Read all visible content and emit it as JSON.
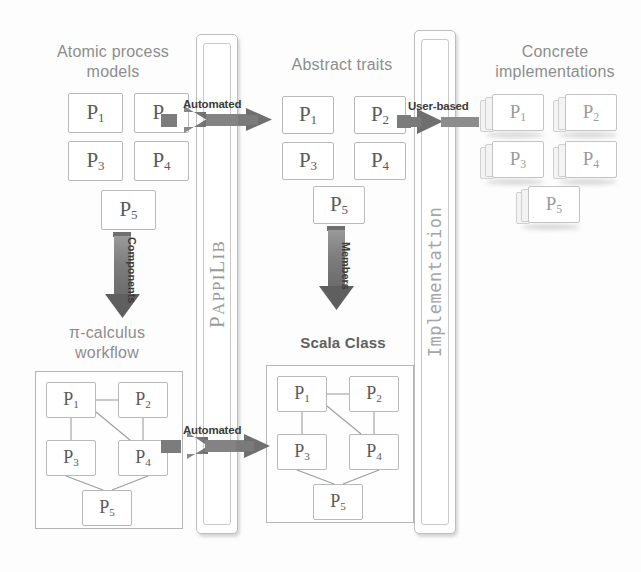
{
  "diagram": {
    "colors": {
      "heading": "#8d8d8d",
      "heading_dark": "#5f6062",
      "box_border": "#b9b9b9",
      "box_text": "#5a5a5a",
      "arrow": "#808080",
      "arrow_dark": "#6e6e6e",
      "arrow_label": "#3b3b3b",
      "pillar_text": "#9a9a9a",
      "background": "#fdfdfd"
    },
    "headings": {
      "atomic_process_models": "Atomic process\nmodels",
      "abstract_traits": "Abstract traits",
      "concrete_implementations": "Concrete\nimplementations",
      "pi_calculus_workflow": "π-calculus\nworkflow",
      "scala_class": "Scala Class"
    },
    "pillars": [
      {
        "name": "pappilib",
        "label": "PAPPILIB",
        "label_caps": "P",
        "label_rest": "APPI",
        "label_caps2": "L",
        "label_rest2": "IB"
      },
      {
        "name": "implementation",
        "label": "Implementation"
      }
    ],
    "arrows": {
      "top_automated": "Automated",
      "bottom_automated": "Automated",
      "user_based": "User-based",
      "components": "Components",
      "members": "Members"
    },
    "process_labels": {
      "p1": "P",
      "p1sub": "1",
      "p2": "P",
      "p2sub": "2",
      "p3": "P",
      "p3sub": "3",
      "p4": "P",
      "p4sub": "4",
      "p5": "P",
      "p5sub": "5"
    },
    "groups": {
      "atomic": [
        "P1",
        "P2",
        "P3",
        "P4",
        "P5"
      ],
      "traits": [
        "P1",
        "P2",
        "P3",
        "P4",
        "P5"
      ],
      "concrete": [
        "P1",
        "P2",
        "P3",
        "P4",
        "P5"
      ],
      "workflow": [
        "P1",
        "P2",
        "P3",
        "P4",
        "P5"
      ],
      "scala": [
        "P1",
        "P2",
        "P3",
        "P4",
        "P5"
      ]
    },
    "workflow_edges": [
      "P1-P2",
      "P1-P3",
      "P1-P4",
      "P2-P4",
      "P3-P5",
      "P4-P5"
    ]
  }
}
